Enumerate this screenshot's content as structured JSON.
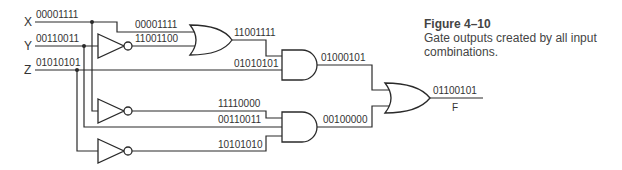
{
  "inputs": {
    "x": {
      "name": "X",
      "value": "00001111"
    },
    "y": {
      "name": "Y",
      "value": "00110011"
    },
    "z": {
      "name": "Z",
      "value": "01010101"
    }
  },
  "gates": {
    "or1": {
      "type": "OR",
      "in_a": "00001111",
      "in_b": "11001100",
      "out": "11001111"
    },
    "and1": {
      "type": "AND",
      "in_b": "01010101",
      "out": "01000101"
    },
    "not_y": {
      "type": "NOT",
      "out": "11001100"
    },
    "not_x": {
      "type": "NOT",
      "out": "11110000"
    },
    "not_z": {
      "type": "NOT",
      "out": "10101010"
    },
    "and2": {
      "type": "AND",
      "in_a": "11110000",
      "in_b": "00110011",
      "in_c": "10101010",
      "out": "00100000"
    },
    "or2": {
      "type": "OR",
      "out": "01100101"
    }
  },
  "output": {
    "name": "F",
    "value": "01100101"
  },
  "caption": {
    "title": "Figure  4–10",
    "description": "Gate outputs created by all input combinations."
  },
  "colors": {
    "line": "#2a2a2a",
    "text": "#333333",
    "background": "#ffffff"
  }
}
